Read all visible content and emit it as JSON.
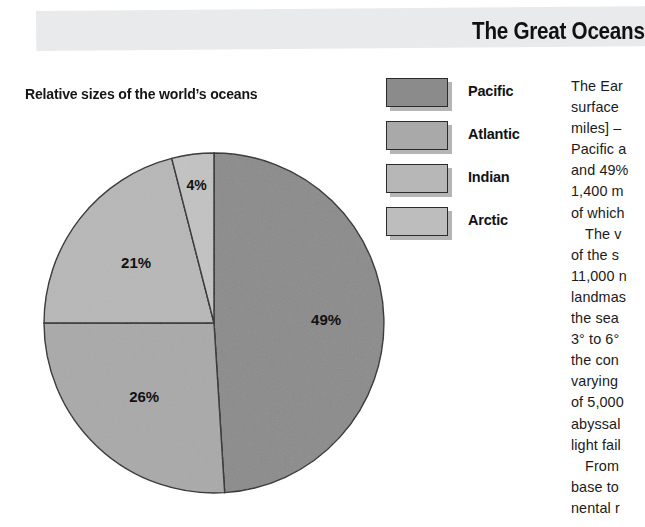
{
  "header": {
    "title": "The Great Oceans",
    "band_color": "#e9eaeb"
  },
  "chart_data": {
    "type": "pie",
    "title": "Relative sizes of the world’s oceans",
    "categories": [
      "Pacific",
      "Atlantic",
      "Indian",
      "Arctic"
    ],
    "values": [
      49,
      26,
      21,
      4
    ],
    "labels": [
      "49%",
      "26%",
      "21%",
      "4%"
    ],
    "colors": [
      "#8b8b8b",
      "#a9a9a9",
      "#b7b7b7",
      "#c2c2c2"
    ],
    "legend_position": "top-right",
    "unit": "%",
    "start_angle_deg": 0,
    "direction": "clockwise",
    "grid": false
  },
  "legend": {
    "items": [
      {
        "label": "Pacific",
        "color": "#8b8b8b"
      },
      {
        "label": "Atlantic",
        "color": "#a9a9a9"
      },
      {
        "label": "Indian",
        "color": "#b7b7b7"
      },
      {
        "label": "Arctic",
        "color": "#bdbdbd"
      }
    ]
  },
  "article": {
    "lines": [
      {
        "text": "The Ear",
        "indent": false
      },
      {
        "text": "surface",
        "indent": false
      },
      {
        "text": "miles] –",
        "indent": false
      },
      {
        "text": "Pacific a",
        "indent": false
      },
      {
        "text": "and 49%",
        "indent": false
      },
      {
        "text": "1,400 m",
        "indent": false
      },
      {
        "text": "of which",
        "indent": false
      },
      {
        "text": "The v",
        "indent": true
      },
      {
        "text": "of the s",
        "indent": false
      },
      {
        "text": "11,000 n",
        "indent": false
      },
      {
        "text": "landmas",
        "indent": false
      },
      {
        "text": "the  sea",
        "indent": false
      },
      {
        "text": "3° to 6°",
        "indent": false
      },
      {
        "text": "the con",
        "indent": false
      },
      {
        "text": "varying",
        "indent": false
      },
      {
        "text": "of 5,000",
        "indent": false
      },
      {
        "text": "abyssal",
        "indent": false
      },
      {
        "text": "light fail",
        "indent": false
      },
      {
        "text": "From",
        "indent": true
      },
      {
        "text": "base to",
        "indent": false
      },
      {
        "text": "nental r",
        "indent": false
      }
    ]
  }
}
